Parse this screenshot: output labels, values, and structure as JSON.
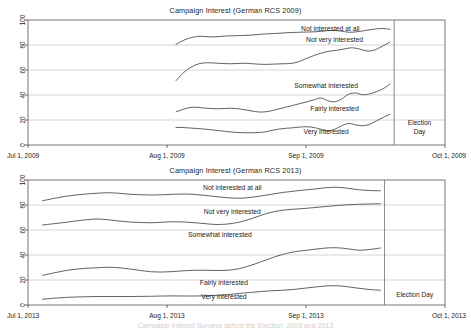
{
  "caption": "Campaign Interest Surveys before the Election, 2009 and 2013",
  "charts": [
    {
      "id": "2009",
      "title": "Campaign Interest (German RCS 2009)",
      "election_label_lines": [
        "Election",
        "Day"
      ],
      "chart_data": {
        "type": "line",
        "title": "Campaign Interest (German RCS 2009)",
        "xlabel": "",
        "ylabel": "",
        "ylim": [
          0,
          100
        ],
        "yticks": [
          0,
          20,
          40,
          60,
          80,
          100
        ],
        "grid": true,
        "legend": "inline-labels",
        "x_axis_type": "date",
        "xlim": [
          "Jul 1, 2009",
          "Oct 1, 2009"
        ],
        "xticks": [
          "Jul 1, 2009",
          "Aug 1, 2009",
          "Sep 1, 2009",
          "Oct 1, 2009"
        ],
        "election_day_x": 0.878,
        "data_start_x": 0.355,
        "data_end_x": 0.868,
        "series": [
          {
            "name": "Not interested at all",
            "label_x": 0.725,
            "label_y": 92.5,
            "values": [
              80.5,
              84.0,
              86.2,
              87.0,
              86.5,
              86.6,
              87.2,
              87.4,
              87.6,
              87.9,
              88.4,
              88.9,
              89.2,
              89.6,
              90.0,
              90.2,
              90.4,
              90.6,
              91.2,
              91.6,
              91.2,
              90.2,
              90.6,
              91.6,
              92.6,
              93.2,
              92.6
            ]
          },
          {
            "name": "Not very interested",
            "label_x": 0.735,
            "label_y": 84.0,
            "values": [
              51.5,
              58.0,
              62.4,
              65.0,
              65.8,
              65.6,
              65.2,
              65.0,
              65.2,
              65.4,
              65.0,
              64.6,
              64.5,
              64.8,
              65.0,
              65.2,
              66.5,
              69.0,
              71.5,
              73.5,
              75.0,
              75.8,
              76.8,
              77.8,
              76.8,
              75.2,
              76.0,
              79.0,
              82.4
            ]
          },
          {
            "name": "Somewhat interested",
            "label_x": 0.715,
            "label_y": 47.0,
            "values": [
              26.5,
              28.5,
              30.0,
              30.2,
              29.6,
              29.2,
              29.0,
              29.2,
              29.4,
              29.0,
              28.2,
              27.2,
              26.4,
              26.6,
              27.6,
              29.0,
              30.4,
              31.8,
              33.2,
              34.6,
              36.2,
              37.6,
              35.4,
              34.6,
              36.8,
              40.6,
              41.6,
              40.2,
              40.8,
              42.6,
              45.0,
              48.8
            ]
          },
          {
            "name": "Fairly interested",
            "label_x": 0.735,
            "label_y": 28.5,
            "values": [
              14.0,
              14.0,
              13.6,
              13.2,
              12.8,
              12.2,
              11.6,
              11.0,
              10.4,
              10.0,
              9.8,
              9.8,
              10.0,
              10.6,
              11.8,
              12.8,
              13.4,
              13.8,
              14.4,
              14.6,
              14.0,
              12.6,
              11.4,
              12.6,
              15.4,
              17.2,
              16.2,
              15.4,
              16.4,
              19.2,
              22.0,
              24.6
            ]
          },
          {
            "name": "Very interested",
            "label_x": 0.715,
            "label_y": 10.0,
            "values": []
          }
        ]
      }
    },
    {
      "id": "2013",
      "title": "Campaign Interest (German RCS 2013)",
      "election_label_lines": [
        "Election Day"
      ],
      "chart_data": {
        "type": "line",
        "title": "Campaign Interest (German RCS 2013)",
        "xlabel": "",
        "ylabel": "",
        "ylim": [
          0,
          100
        ],
        "yticks": [
          0,
          20,
          40,
          60,
          80,
          100
        ],
        "grid": true,
        "legend": "inline-labels",
        "x_axis_type": "date",
        "xlim": [
          "Jul 1, 2013",
          "Oct 1, 2013"
        ],
        "xticks": [
          "Jul 1, 2013",
          "Aug 1, 2013",
          "Sep 1, 2013",
          "Oct 1, 2013"
        ],
        "election_day_x": 0.855,
        "data_start_x": 0.035,
        "data_end_x": 0.845,
        "series": [
          {
            "name": "Not interested at all",
            "label_x": 0.49,
            "label_y": 93.5,
            "values": [
              83.4,
              85.2,
              86.8,
              88.0,
              88.8,
              89.4,
              89.8,
              89.4,
              88.6,
              88.2,
              88.0,
              88.2,
              88.6,
              88.8,
              88.4,
              87.6,
              86.6,
              85.8,
              85.4,
              86.0,
              87.2,
              88.6,
              90.0,
              91.0,
              92.0,
              92.8,
              93.8,
              94.2,
              93.4,
              92.2,
              91.6,
              91.4
            ]
          },
          {
            "name": "Not very interested",
            "label_x": 0.49,
            "label_y": 74.0,
            "values": [
              64.0,
              65.0,
              66.0,
              67.2,
              68.2,
              68.8,
              68.2,
              67.2,
              66.4,
              66.0,
              65.8,
              66.2,
              66.6,
              66.4,
              65.8,
              65.0,
              64.4,
              64.8,
              66.2,
              68.6,
              71.6,
              74.2,
              75.8,
              76.6,
              77.2,
              78.0,
              78.8,
              79.6,
              80.2,
              80.6,
              80.8,
              81.0
            ]
          },
          {
            "name": "Somewhat interested",
            "label_x": 0.46,
            "label_y": 55.5,
            "values": [
              23.8,
              25.6,
              27.4,
              28.6,
              29.4,
              29.8,
              30.2,
              29.8,
              28.8,
              27.6,
              26.6,
              26.4,
              26.8,
              27.4,
              27.8,
              27.8,
              27.6,
              27.8,
              29.0,
              31.4,
              34.4,
              37.6,
              40.4,
              42.4,
              43.6,
              44.6,
              45.6,
              45.8,
              45.0,
              43.8,
              44.4,
              45.6
            ]
          },
          {
            "name": "Fairly interested",
            "label_x": 0.47,
            "label_y": 17.5,
            "values": [
              4.6,
              5.4,
              6.0,
              6.4,
              6.6,
              6.8,
              6.8,
              6.8,
              6.8,
              6.9,
              7.0,
              7.2,
              7.3,
              7.2,
              7.2,
              7.4,
              7.8,
              8.4,
              9.2,
              10.0,
              10.8,
              11.4,
              11.8,
              12.4,
              13.4,
              14.4,
              15.2,
              15.4,
              14.6,
              13.4,
              12.4,
              11.8
            ]
          },
          {
            "name": "Very interested",
            "label_x": 0.47,
            "label_y": 6.0,
            "values": []
          }
        ]
      }
    }
  ]
}
